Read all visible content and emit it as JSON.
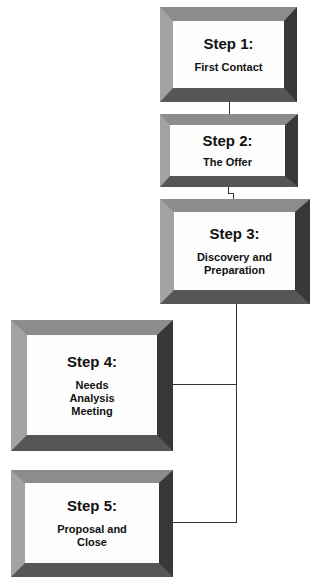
{
  "diagram": {
    "type": "process-flow",
    "steps": [
      {
        "title": "Step 1:",
        "description": "First Contact"
      },
      {
        "title": "Step 2:",
        "description": "The Offer"
      },
      {
        "title": "Step 3:",
        "description": "Discovery and Preparation"
      },
      {
        "title": "Step 4:",
        "description": "Needs Analysis Meeting"
      },
      {
        "title": "Step 5:",
        "description": "Proposal and Close"
      }
    ],
    "connections": [
      {
        "from": 1,
        "to": 2
      },
      {
        "from": 2,
        "to": 3
      },
      {
        "from": 3,
        "to": 4
      },
      {
        "from": 3,
        "to": 5
      }
    ],
    "colors": {
      "bevel_top": "#8c8c8c",
      "bevel_left": "#a3a3a3",
      "bevel_right": "#383838",
      "bevel_bottom": "#565656",
      "connector": "#333333",
      "box_face": "#fdfdfd"
    }
  }
}
